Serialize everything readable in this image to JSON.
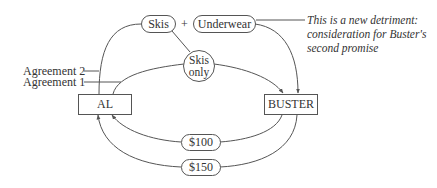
{
  "diagram": {
    "parties": {
      "left": "AL",
      "right": "BUSTER"
    },
    "items": {
      "skis": "Skis",
      "plus": "+",
      "underwear": "Underwear",
      "skis_only_line1": "Skis",
      "skis_only_line2": "only",
      "payment_1": "$100",
      "payment_2": "$150"
    },
    "labels": {
      "agreement_2": "Agreement 2",
      "agreement_1": "Agreement 1"
    },
    "annotation": {
      "line1": "This is a new detriment:",
      "line2": "consideration for Buster's",
      "line3": "second promise"
    },
    "colors": {
      "stroke": "#555555",
      "text": "#333333",
      "background": "#ffffff"
    }
  }
}
